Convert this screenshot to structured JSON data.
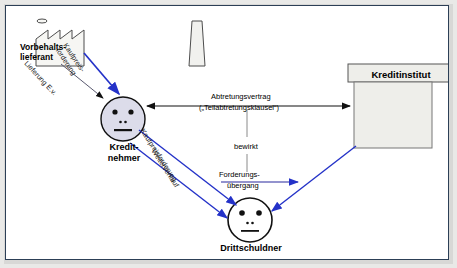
{
  "diagram": {
    "colors": {
      "blue_arrow": "#2432c8",
      "thin_blue_line": "#5a5ab4",
      "black_arrow": "#111111",
      "box_fill": "#eeeeea",
      "box_stroke": "#555555",
      "face_fill": "#dcdcea",
      "frame_border": "#2c3f56",
      "page_bg": "#ffffff",
      "outer_bg": "#e9e9e7"
    },
    "nodes": [
      {
        "id": "vorbehaltslieferant",
        "label_line1": "Vorbehalts-",
        "label_line2": "lieferant",
        "shape": "factory-with-chimney"
      },
      {
        "id": "kreditnehmer",
        "label_line1": "Kredit-",
        "label_line2": "nehmer",
        "shape": "face-circle"
      },
      {
        "id": "kreditinstitut",
        "label": "Kreditinstitut",
        "shape": "bank-building"
      },
      {
        "id": "drittschuldner",
        "label": "Drittschuldner",
        "shape": "face-circle"
      }
    ],
    "edges": [
      {
        "id": "kaufpreisforderung-lieferant",
        "label_line1": "Kaufpreis-",
        "label_line2": "forderung",
        "color": "blue",
        "from": "vorbehaltslieferant",
        "to": "kreditnehmer"
      },
      {
        "id": "lieferung-ev",
        "label": "Lieferung E.v.",
        "color": "black",
        "from": "vorbehaltslieferant",
        "to": "kreditnehmer"
      },
      {
        "id": "abtretungsvertrag",
        "label_line1": "Abtretungsvertrag",
        "label_line2": "(„Teilabtretungsklausel“)",
        "color": "black",
        "from": "kreditnehmer",
        "to": "kreditinstitut",
        "arrow": "double"
      },
      {
        "id": "bewirkt",
        "label": "bewirkt",
        "color": "grey",
        "from": "abtretungsvertrag",
        "to": "forderungsuebergang"
      },
      {
        "id": "forderungsuebergang",
        "label_line1": "Forderungs-",
        "label_line2": "übergang",
        "color": "blue",
        "from": "kreditnehmer",
        "to": "kreditinstitut"
      },
      {
        "id": "kaufpreisforderung-kreditnehmer",
        "label": "Kaufpreisforderung",
        "color": "blue",
        "from": "kreditnehmer",
        "to": "drittschuldner"
      },
      {
        "id": "weiterverkauf",
        "label": "Weiterverkauf",
        "color": "blue",
        "from": "kreditnehmer",
        "to": "drittschuldner"
      },
      {
        "id": "ki-to-ds",
        "label": "",
        "color": "blue",
        "from": "kreditinstitut",
        "to": "drittschuldner"
      }
    ]
  }
}
